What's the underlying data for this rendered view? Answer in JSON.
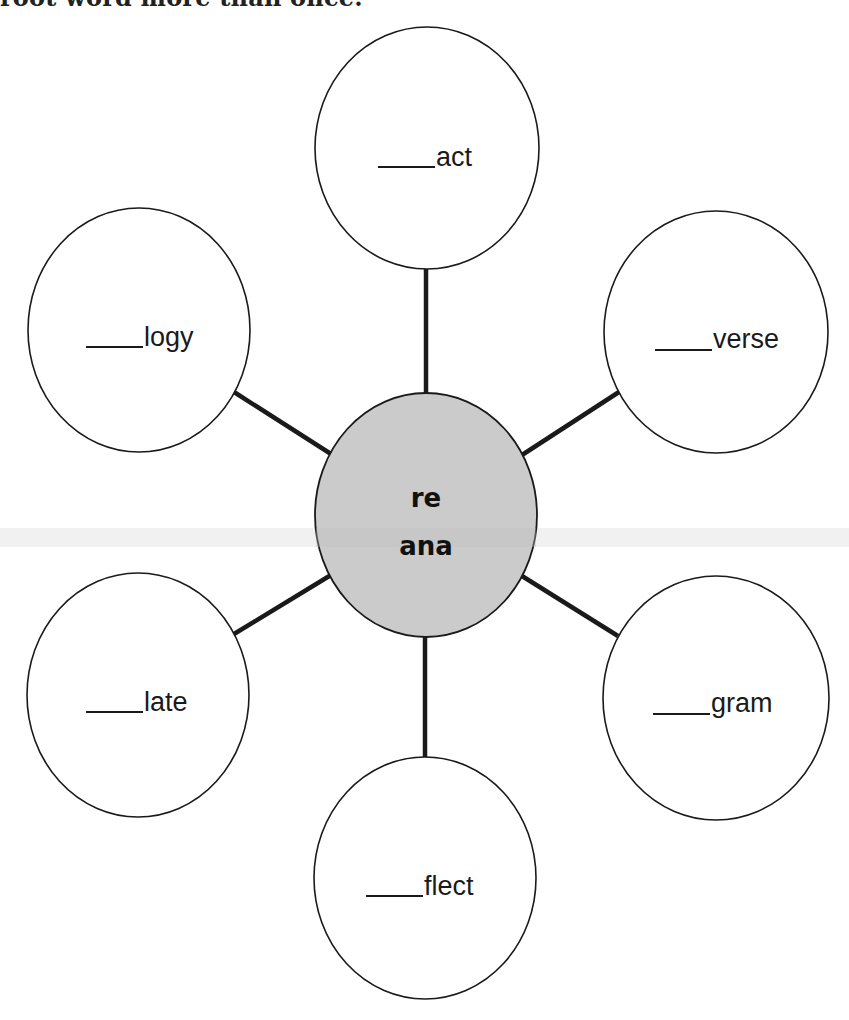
{
  "header": {
    "instruction_tail": "root word more than once."
  },
  "diagram": {
    "type": "word-web",
    "center": {
      "lines": [
        "re",
        "ana"
      ],
      "fill": "#cbcbcb"
    },
    "blank": "____",
    "nodes": [
      {
        "id": "top",
        "suffix": "act"
      },
      {
        "id": "upper-left",
        "suffix": "logy"
      },
      {
        "id": "upper-right",
        "suffix": "verse"
      },
      {
        "id": "lower-left",
        "suffix": "late"
      },
      {
        "id": "lower-right",
        "suffix": "gram"
      },
      {
        "id": "bottom",
        "suffix": "flect"
      }
    ],
    "colors": {
      "stroke": "#1a1a1a",
      "center_fill": "#cbcbcb",
      "node_fill": "#ffffff"
    }
  }
}
